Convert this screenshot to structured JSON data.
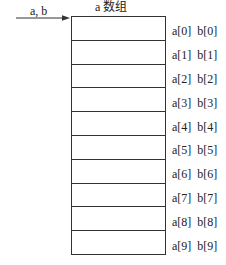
{
  "diagram": {
    "title": "a 数组",
    "pointer": {
      "label": "a, b",
      "target": "a[0]"
    },
    "colors": {
      "line": "#333333",
      "text": "#222222",
      "background": "#ffffff"
    },
    "cells": [
      {
        "a": "a[0]",
        "b": "b[0]"
      },
      {
        "a": "a[1]",
        "b": "b[1]"
      },
      {
        "a": "a[2]",
        "b": "b[2]"
      },
      {
        "a": "a[3]",
        "b": "b[3]"
      },
      {
        "a": "a[4]",
        "b": "b[4]"
      },
      {
        "a": "a[5]",
        "b": "b[5]"
      },
      {
        "a": "a[6]",
        "b": "b[6]"
      },
      {
        "a": "a[7]",
        "b": "b[7]"
      },
      {
        "a": "a[8]",
        "b": "b[8]"
      },
      {
        "a": "a[9]",
        "b": "b[9]"
      }
    ]
  }
}
